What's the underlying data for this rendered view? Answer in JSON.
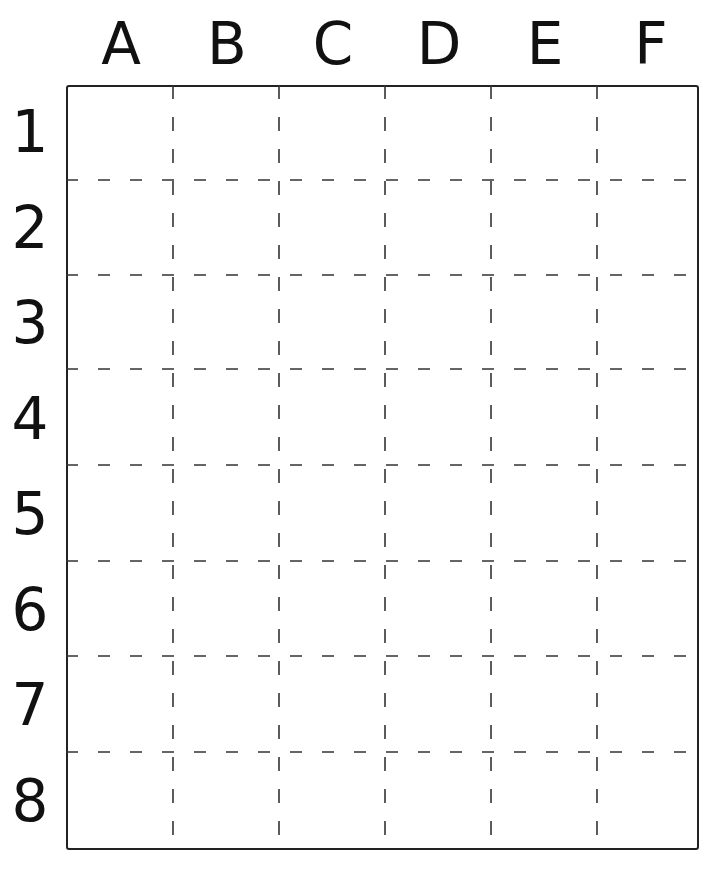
{
  "grid": {
    "columns": [
      "A",
      "B",
      "C",
      "D",
      "E",
      "F"
    ],
    "rows": [
      "1",
      "2",
      "3",
      "4",
      "5",
      "6",
      "7",
      "8"
    ],
    "cells_filled": [],
    "line_color": "#333333",
    "border_color": "#222222"
  },
  "labels": {
    "col_0": "A",
    "col_1": "B",
    "col_2": "C",
    "col_3": "D",
    "col_4": "E",
    "col_5": "F",
    "row_0": "1",
    "row_1": "2",
    "row_2": "3",
    "row_3": "4",
    "row_4": "5",
    "row_5": "6",
    "row_6": "7",
    "row_7": "8"
  }
}
